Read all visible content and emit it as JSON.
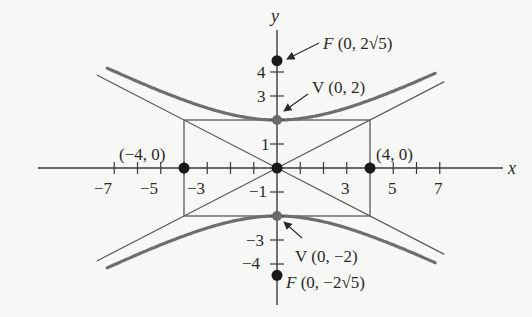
{
  "chart_data": {
    "type": "diagram",
    "title": "",
    "curve": "hyperbola",
    "equation": "y^2/4 - x^2/16 = 1",
    "a": 2,
    "b": 4,
    "c": "2*sqrt(5)",
    "asymptotes": [
      "y = x/2",
      "y = -x/2"
    ],
    "xlabel": "x",
    "ylabel": "y",
    "x_ticks": [
      -7,
      -6,
      -5,
      -4,
      -3,
      -2,
      -1,
      1,
      2,
      3,
      4,
      5,
      6,
      7
    ],
    "x_tick_labels": [
      -7,
      -5,
      -3,
      3,
      5,
      7
    ],
    "y_ticks": [
      -4,
      -3,
      -2,
      -1,
      1,
      2,
      3,
      4
    ],
    "y_tick_labels": [
      -4,
      -3,
      -1,
      1,
      3,
      4
    ],
    "xlim": [
      -10.3,
      9.8
    ],
    "ylim": [
      -5.8,
      5.8
    ],
    "grid": false,
    "rectangle": {
      "x": [
        -4,
        4
      ],
      "y": [
        -2,
        2
      ]
    },
    "points": [
      {
        "name": "F",
        "x": 0,
        "y": 4.472,
        "label": "F (0, 2√5)"
      },
      {
        "name": "V",
        "x": 0,
        "y": 2,
        "label": "V (0, 2)"
      },
      {
        "name": "V",
        "x": 0,
        "y": -2,
        "label": "V (0, −2)"
      },
      {
        "name": "F",
        "x": 0,
        "y": -4.472,
        "label": "F (0, −2√5)"
      },
      {
        "name": "",
        "x": -4,
        "y": 0,
        "label": "(−4, 0)"
      },
      {
        "name": "",
        "x": 4,
        "y": 0,
        "label": "(4, 0)"
      },
      {
        "name": "",
        "x": 0,
        "y": 0,
        "label": ""
      }
    ]
  },
  "axes": {
    "x_label": "x",
    "y_label": "y",
    "x_tick_labels": [
      "−7",
      "−5",
      "−3",
      "3",
      "5",
      "7"
    ],
    "y_tick_labels": [
      "4",
      "3",
      "1",
      "−1",
      "−3",
      "−4"
    ]
  },
  "labels": {
    "focus_top_letter": "F",
    "focus_top_coords": " (0, 2",
    "focus_top_sqrt": "√5",
    "focus_top_close": ")",
    "vertex_top_letter": "V",
    "vertex_top_coords": " (0, 2)",
    "vertex_bottom_letter": "V",
    "vertex_bottom_coords": " (0, −2)",
    "focus_bottom_letter": "F",
    "focus_bottom_coords": " (0, −2",
    "focus_bottom_sqrt": "√5",
    "focus_bottom_close": ")",
    "left_point": "(−4, 0)",
    "right_point": "(4, 0)"
  },
  "colors": {
    "axis": "#3a3a3a",
    "curve": "#6e6e6e",
    "asymptote": "#5a5a5a",
    "rectangle": "#5a5a5a",
    "point": "#1a1a1a",
    "vertex": "#6a6a6a",
    "background": "#f7f7f5"
  }
}
